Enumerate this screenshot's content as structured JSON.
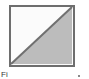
{
  "figure": {
    "name": "square-split-by-diagonal",
    "canvas": {
      "width": 89,
      "height": 79,
      "background": "#ffffff"
    },
    "square": {
      "x": 1,
      "y": 1,
      "width": 64,
      "height": 60,
      "border_color": "#6e6e6e",
      "border_width": 2
    },
    "regions": [
      {
        "label": "upper-left-triangle",
        "fill": "#fbfbfb",
        "points": "2,2 63,2 2,59"
      },
      {
        "label": "lower-right-triangle",
        "fill": "#bcbcbc",
        "points": "63,2 63,59 2,59"
      }
    ],
    "diagonal": {
      "label": "diagonal-line",
      "color": "#707070",
      "width": 2,
      "x1": 2,
      "y1": 59,
      "x2": 63,
      "y2": 2
    }
  },
  "caption": {
    "text": "Fi",
    "dot": ""
  }
}
